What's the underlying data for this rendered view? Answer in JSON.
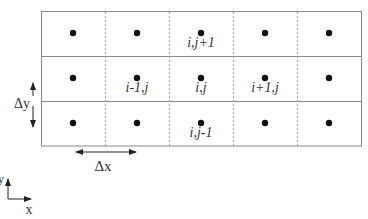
{
  "diagram": {
    "type": "finite-difference-grid",
    "grid": {
      "rows": 3,
      "cols": 5,
      "left": 41,
      "top": 11,
      "right": 362,
      "bottom": 146,
      "line_color": "#888888",
      "dashed_color": "#aaaaaa"
    },
    "points": [
      {
        "row": 0,
        "col": 0
      },
      {
        "row": 0,
        "col": 1
      },
      {
        "row": 0,
        "col": 2
      },
      {
        "row": 0,
        "col": 3
      },
      {
        "row": 0,
        "col": 4
      },
      {
        "row": 1,
        "col": 0
      },
      {
        "row": 1,
        "col": 1
      },
      {
        "row": 1,
        "col": 2
      },
      {
        "row": 1,
        "col": 3
      },
      {
        "row": 1,
        "col": 4
      },
      {
        "row": 2,
        "col": 0
      },
      {
        "row": 2,
        "col": 1
      },
      {
        "row": 2,
        "col": 2
      },
      {
        "row": 2,
        "col": 3
      },
      {
        "row": 2,
        "col": 4
      }
    ],
    "node_labels": {
      "top": "i,j+1",
      "left": "i-1,j",
      "center": "i,j",
      "right": "i+1,j",
      "bottom": "i,j-1"
    },
    "dimension_labels": {
      "dy": "Δy",
      "dx": "Δx"
    },
    "axes": {
      "x": "x",
      "y": "y"
    }
  }
}
